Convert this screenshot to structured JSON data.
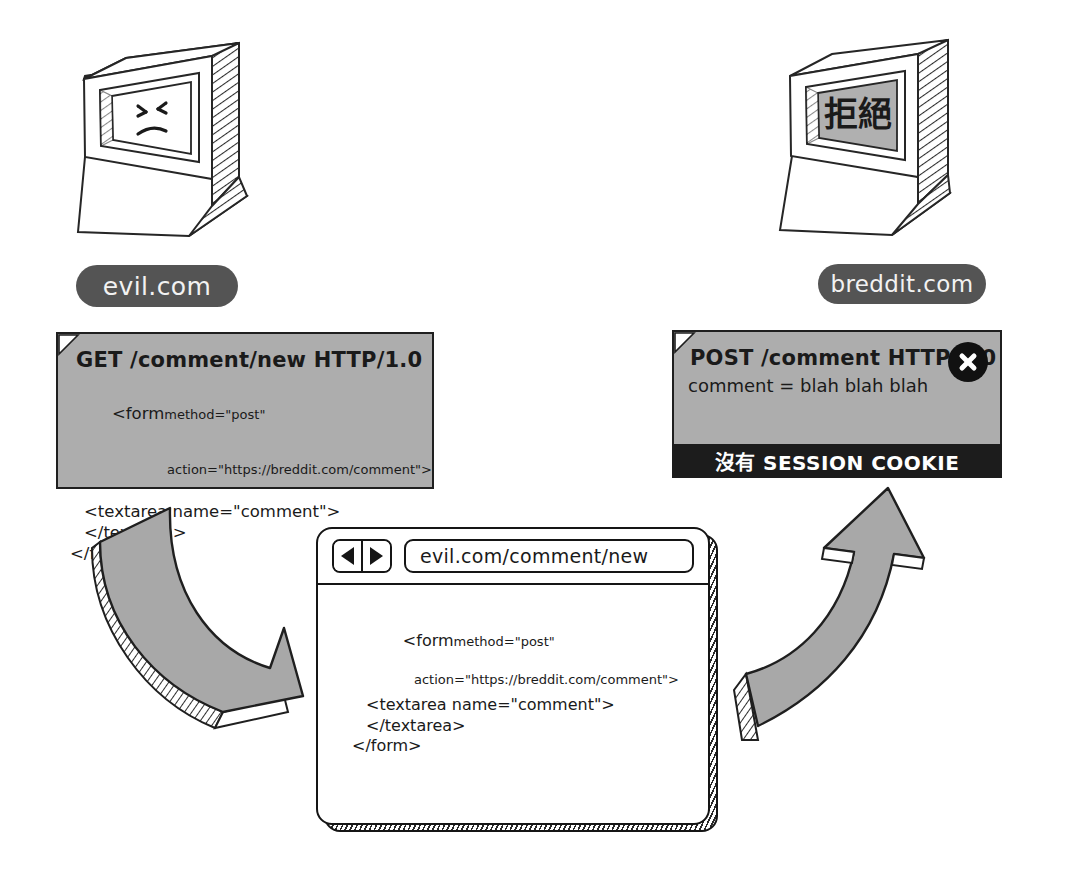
{
  "diagram": {
    "palette": {
      "ink": "#1a1a1a",
      "card_gray": "#adadad",
      "pill_gray": "#545454",
      "arrow_gray": "#a8a8a8",
      "banner_black": "#1c1c1c",
      "screen_gray": "#b0b0b0",
      "paper_white": "#ffffff"
    }
  },
  "left": {
    "monitor": {
      "icon": "crt-monitor-icon",
      "face": "angry-face-icon",
      "screen_text": ""
    },
    "label": "evil.com",
    "request_card": {
      "fold_icon": "page-fold-icon",
      "request_line": {
        "method": "GET",
        "path": "/comment/new",
        "version": "HTTP/1.0",
        "full": "GET /comment/new HTTP/1.0"
      },
      "code": [
        "<form method=\"post\"",
        "action=\"https://breddit.com/comment\">",
        "<textarea name=\"comment\">",
        "</textarea>",
        "</form>"
      ],
      "code_rendered": {
        "line1_tag": "<form",
        "line1_attr": "method=\"post\"",
        "line2_attr": "action=\"https://breddit.com/comment\">",
        "line3": "<textarea name=\"comment\">",
        "line4": "</textarea>",
        "line5": "</form>"
      }
    },
    "arrow": {
      "icon": "curved-arrow-down-right-icon",
      "direction": "down-right"
    }
  },
  "right": {
    "monitor": {
      "icon": "crt-monitor-icon",
      "screen_text": "拒絕"
    },
    "label": "breddit.com",
    "response_card": {
      "fold_icon": "page-fold-icon",
      "request_line": {
        "method": "POST",
        "path": "/comment",
        "version": "HTTP/1.0",
        "full": "POST /comment HTTP/1.0"
      },
      "body_line": "comment = blah blah blah",
      "reject_icon": "circle-x-icon",
      "banner": "沒有 SESSION COOKIE"
    },
    "arrow": {
      "icon": "curved-arrow-up-right-icon",
      "direction": "up-right"
    }
  },
  "browser": {
    "back_icon": "back-arrow-icon",
    "forward_icon": "forward-arrow-icon",
    "url": "evil.com/comment/new",
    "url_placeholder": "Enter address",
    "page_code": {
      "line1_tag": "<form",
      "line1_attr": "method=\"post\"",
      "line2_attr": "action=\"https://breddit.com/comment\">",
      "line3": "<textarea name=\"comment\">",
      "line4": "</textarea>",
      "line5": "</form>"
    }
  }
}
